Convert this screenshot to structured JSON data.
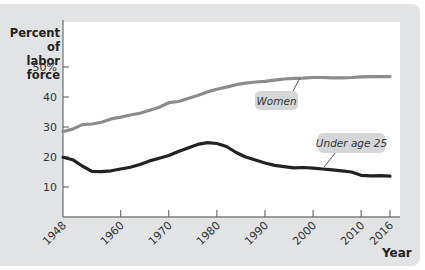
{
  "chart_data": {
    "type": "line",
    "title": "",
    "xlabel": "Year",
    "ylabel": "Percent of labor force",
    "ylim": [
      0,
      55
    ],
    "xlim": [
      1948,
      2016
    ],
    "x_ticks": [
      "1948",
      "1960",
      "1970",
      "1980",
      "1990",
      "2000",
      "2010",
      "2016"
    ],
    "y_ticks": [
      "10",
      "20",
      "30",
      "40",
      "50%"
    ],
    "grid": false,
    "legend": "inline callouts",
    "x": [
      1948,
      1950,
      1952,
      1954,
      1956,
      1958,
      1960,
      1962,
      1964,
      1966,
      1968,
      1970,
      1972,
      1974,
      1976,
      1978,
      1980,
      1982,
      1984,
      1986,
      1988,
      1990,
      1992,
      1994,
      1996,
      1998,
      2000,
      2002,
      2004,
      2006,
      2008,
      2010,
      2012,
      2014,
      2016
    ],
    "series": [
      {
        "name": "Women",
        "color": "#8c8c8c",
        "values": [
          28.5,
          29.3,
          30.8,
          31.0,
          31.6,
          32.7,
          33.3,
          34.0,
          34.6,
          35.6,
          36.6,
          38.1,
          38.5,
          39.5,
          40.5,
          41.7,
          42.6,
          43.3,
          44.1,
          44.6,
          45.0,
          45.2,
          45.6,
          46.0,
          46.2,
          46.3,
          46.5,
          46.5,
          46.4,
          46.4,
          46.5,
          46.7,
          46.8,
          46.8,
          46.8
        ]
      },
      {
        "name": "Under age 25",
        "color": "#222222",
        "values": [
          19.9,
          19.1,
          17.0,
          15.2,
          15.1,
          15.4,
          16.0,
          16.6,
          17.5,
          18.7,
          19.6,
          20.5,
          21.8,
          23.0,
          24.2,
          24.8,
          24.5,
          23.5,
          21.5,
          20.0,
          19.0,
          18.0,
          17.2,
          16.8,
          16.4,
          16.5,
          16.3,
          16.0,
          15.7,
          15.4,
          15.0,
          13.9,
          13.7,
          13.8,
          13.6
        ]
      }
    ]
  },
  "axis": {
    "y_title_line1": "Percent of",
    "y_title_line2": "labor force",
    "x_title": "Year"
  },
  "callouts": {
    "women": "Women",
    "under25": "Under age 25"
  }
}
